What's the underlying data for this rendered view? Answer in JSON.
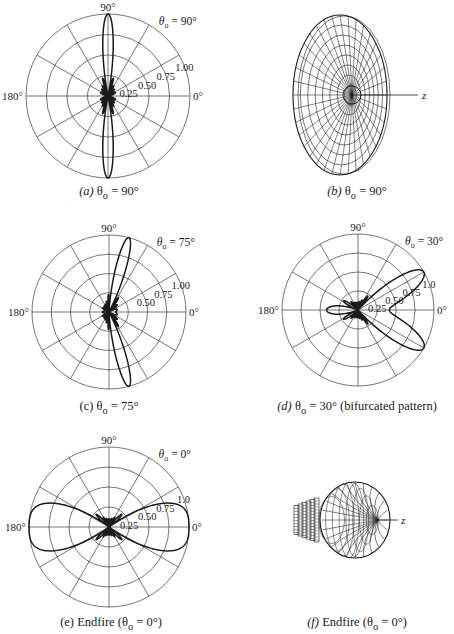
{
  "chart_data": [
    {
      "id": "a",
      "type": "polar",
      "title": "",
      "caption_prefix": "(a)",
      "caption": "(a) θo = 90°",
      "theta_label": "θo = 90°",
      "steer_deg": 90,
      "center": [
        108,
        96
      ],
      "radius": 82,
      "angle_labels": {
        "top": "90°",
        "left": "180°",
        "right": "0°"
      },
      "radial_ticks": [
        "0.25",
        "0.50",
        "0.75",
        "1.00"
      ],
      "radial_values": [
        0.25,
        0.5,
        0.75,
        1.0
      ],
      "spoke_step_deg": 30,
      "pattern": {
        "model": "array_factor",
        "N": 10,
        "d_over_lambda": 0.5,
        "symmetric": true
      },
      "description": "Broadside pattern: main lobes along ±90°, small side lobes near center"
    },
    {
      "id": "c",
      "type": "polar",
      "caption": "(c) θo = 75°",
      "theta_label": "θo = 75°",
      "steer_deg": 75,
      "center": [
        109,
        312
      ],
      "radius": 77,
      "angle_labels": {
        "top": "90°",
        "left": "180°",
        "right": "0°"
      },
      "radial_ticks": [
        "0.50",
        "0.75",
        "1.00"
      ],
      "radial_values": [
        0.25,
        0.5,
        0.75,
        1.0
      ],
      "spoke_step_deg": 30,
      "pattern": {
        "model": "array_factor",
        "N": 10,
        "d_over_lambda": 0.5,
        "symmetric": true
      },
      "description": "Main lobes steered to ±75°"
    },
    {
      "id": "d",
      "type": "polar",
      "caption": "(d) θo = 30° (bifurcated pattern)",
      "theta_label": "θo = 30°",
      "steer_deg": 30,
      "center": [
        358,
        310
      ],
      "radius": 76,
      "angle_labels": {
        "top": "90°",
        "left": "180°",
        "right": "0°"
      },
      "radial_ticks": [
        "0.25",
        "0.50",
        "0.75",
        "1.0"
      ],
      "radial_values": [
        0.25,
        0.5,
        0.75,
        1.0
      ],
      "spoke_step_deg": 30,
      "pattern": {
        "model": "array_factor",
        "N": 10,
        "d_over_lambda": 0.5,
        "symmetric": true
      },
      "description": "Bifurcated main lobe with peaks at ±30°, dip at 0°"
    },
    {
      "id": "e",
      "type": "polar",
      "caption": "(e) Endfire (θo = 0°)",
      "theta_label": "θo = 0°",
      "steer_deg": 0,
      "center": [
        109,
        527
      ],
      "radius": 80,
      "angle_labels": {
        "top": "90°",
        "left": "180°",
        "right": "0°"
      },
      "radial_ticks": [
        "0.25",
        "0.50",
        "0.75",
        "1.0"
      ],
      "radial_values": [
        0.25,
        0.5,
        0.75,
        1.0
      ],
      "spoke_step_deg": 30,
      "pattern": {
        "model": "array_factor",
        "N": 10,
        "d_over_lambda": 0.5,
        "symmetric": true
      },
      "description": "Endfire main lobe along 0°"
    }
  ],
  "panels_3d": [
    {
      "id": "b",
      "caption": "(b) θo = 90°",
      "axis_label": "z",
      "shape": "disc"
    },
    {
      "id": "f",
      "caption": "(f) Endfire (θo = 0°)",
      "axis_label": "z",
      "shape": "bulb"
    }
  ],
  "captions": {
    "a": {
      "letter": "(a)",
      "rest": " θ",
      "sub": "o",
      "tail": " = 90°"
    },
    "b": {
      "letter": "(b)",
      "rest": "  θ",
      "sub": "o",
      "tail": " = 90°"
    },
    "c": {
      "letter": "(c)",
      "rest": " θ",
      "sub": "o",
      "tail": " = 75°"
    },
    "d": {
      "letter": "(d)",
      "rest": "  θ",
      "sub": "o",
      "tail": " = 30° (bifurcated pattern)"
    },
    "e": {
      "letter": "(e)",
      "rest": "  Endfire (θ",
      "sub": "o",
      "tail": " = 0°)"
    },
    "f": {
      "letter": "(f)",
      "rest": " Endfire (θ",
      "sub": "o",
      "tail": " = 0°)"
    }
  },
  "colors": {
    "ink": "#1a1a1a",
    "grid": "#3a3a3a",
    "background": "#ffffff"
  }
}
